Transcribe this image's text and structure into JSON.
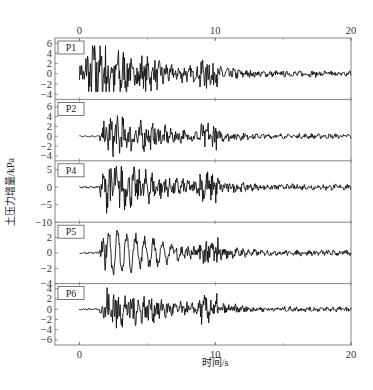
{
  "chart_data": {
    "type": "line",
    "title": "",
    "xlabel": "时间/s",
    "ylabel": "土压力增量/kPa",
    "xlim": [
      -1.8,
      20
    ],
    "x_ticks": [
      0,
      10,
      20
    ],
    "x_minor_ticks": [
      5,
      15
    ],
    "top_axis_ticks": [
      0,
      10,
      20
    ],
    "grid": false,
    "legend": null,
    "panels": [
      {
        "name": "P1",
        "ylim": [
          -5,
          7
        ],
        "y_ticks": [
          6,
          4,
          2,
          0,
          -2,
          -4
        ],
        "onset_s": 0,
        "peak": 5.5,
        "trough": -3.5
      },
      {
        "name": "P2",
        "ylim": [
          -5,
          7.5
        ],
        "y_ticks": [
          6,
          4,
          2,
          0,
          -2,
          -4
        ],
        "onset_s": 1.5,
        "peak": 4.5,
        "trough": -4.2
      },
      {
        "name": "P4",
        "ylim": [
          -10,
          7.5
        ],
        "y_ticks": [
          5,
          0,
          -5,
          -10
        ],
        "onset_s": 1.5,
        "peak": 6,
        "trough": -7.5
      },
      {
        "name": "P5",
        "ylim": [
          -4,
          4
        ],
        "y_ticks": [
          2,
          0,
          -2,
          -4
        ],
        "onset_s": 1.5,
        "peak": 3.3,
        "trough": -3
      },
      {
        "name": "P6",
        "ylim": [
          -7,
          5
        ],
        "y_ticks": [
          4,
          2,
          0,
          -2,
          -4,
          -6
        ],
        "onset_s": 1.5,
        "peak": 4.5,
        "trough": -4.5
      }
    ],
    "series_description": "Earth-pressure increment time histories; quiet baseline until ~1.5 s, strong shaking 1.5–6 s with second burst near 9–10 s, decaying small oscillations to 20 s"
  },
  "labels": {
    "xlabel": "时间/s",
    "ylabel": "土压力增量/kPa",
    "x_tick_0": "0",
    "x_tick_10": "10",
    "x_tick_20": "20"
  }
}
